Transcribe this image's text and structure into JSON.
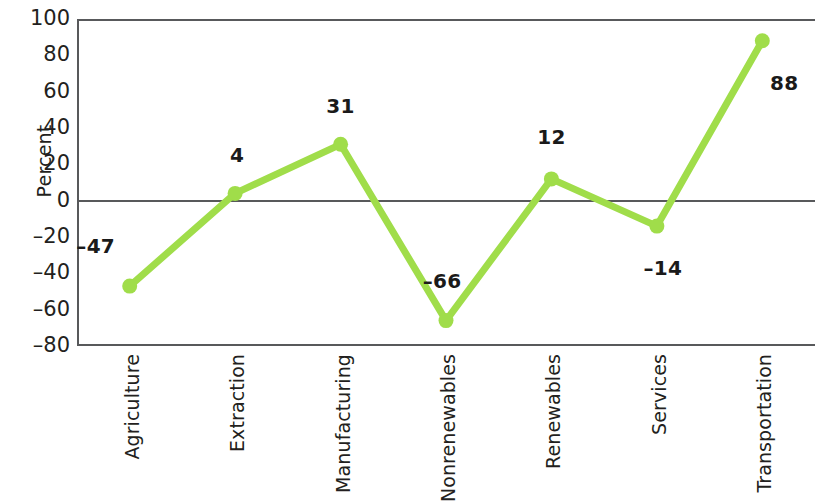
{
  "chart_data": {
    "type": "line",
    "title": "",
    "xlabel": "",
    "ylabel": "Percent",
    "categories": [
      "Agriculture",
      "Extraction",
      "Manufacturing",
      "Nonrenewables",
      "Renewables",
      "Services",
      "Transportation"
    ],
    "values": [
      -47,
      4,
      31,
      -66,
      12,
      -14,
      88
    ],
    "point_labels": [
      "–47",
      "4",
      "31",
      "–66",
      "12",
      "–14",
      "88"
    ],
    "ylim": [
      -80,
      100
    ],
    "yticks": [
      100,
      80,
      60,
      40,
      20,
      0,
      -20,
      -40,
      -60,
      -80
    ],
    "ytick_labels": [
      "100",
      "80",
      "60",
      "40",
      "20",
      "0",
      "–20",
      "–40",
      "–60",
      "–80"
    ],
    "grid": false,
    "legend": null,
    "series_color": "#a0dd4a",
    "axis_color": "#58595b",
    "zero_line": 0,
    "marker": "circle",
    "label_offsets": [
      {
        "dx": -34,
        "dy": -40
      },
      {
        "dx": 2,
        "dy": -38
      },
      {
        "dx": 0,
        "dy": -38
      },
      {
        "dx": -4,
        "dy": -40
      },
      {
        "dx": 0,
        "dy": -42
      },
      {
        "dx": 6,
        "dy": 42
      },
      {
        "dx": 22,
        "dy": 42
      }
    ]
  }
}
